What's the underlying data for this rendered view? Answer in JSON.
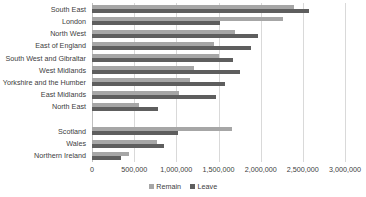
{
  "chart_data": {
    "type": "bar",
    "orientation": "horizontal",
    "title": "",
    "subtitle": "",
    "xlabel": "",
    "ylabel": "",
    "xlim": [
      0,
      3000000
    ],
    "xticks": [
      0,
      500000,
      1000000,
      1500000,
      2000000,
      2500000,
      3000000
    ],
    "xtick_labels": [
      "0",
      "500,000",
      "1,000,000",
      "1,500,000",
      "2,000,000",
      "2,500,000",
      "3,000,000"
    ],
    "grid": true,
    "legend_position": "bottom",
    "categories": [
      "South East",
      "London",
      "North West",
      "East of England",
      "South West and Gibraltar",
      "West Midlands",
      "Yorkshire and the Humber",
      "East Midlands",
      "North East",
      "",
      "Scotland",
      "Wales",
      "Northern Ireland"
    ],
    "series": [
      {
        "name": "Remain",
        "color": "#a6a6a6",
        "values": [
          2391718,
          2263519,
          1699020,
          1448616,
          1503019,
          1207175,
          1158298,
          1033036,
          562595,
          null,
          1661191,
          772347,
          440707
        ]
      },
      {
        "name": "Leave",
        "color": "#5e5e5e",
        "values": [
          2567965,
          1513232,
          1966925,
          1880367,
          1669711,
          1755687,
          1580937,
          1475479,
          778103,
          null,
          1018322,
          854572,
          349442
        ]
      }
    ]
  },
  "legend": {
    "items": [
      {
        "label": "Remain",
        "color": "#a6a6a6",
        "marker": "square-swatch-icon"
      },
      {
        "label": "Leave",
        "color": "#5e5e5e",
        "marker": "square-swatch-icon"
      }
    ]
  }
}
